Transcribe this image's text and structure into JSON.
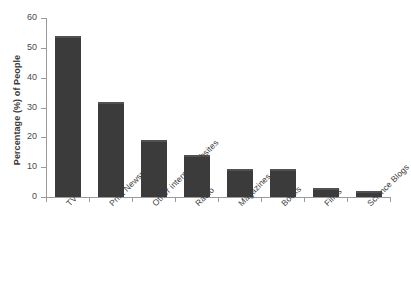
{
  "chart_data": {
    "type": "bar",
    "title": "",
    "subtitle": "",
    "xlabel": "",
    "ylabel": "Percentage (%) of People",
    "categories": [
      "TV",
      "Print Newspapers",
      "Other internet websites",
      "Radio",
      "Magazines",
      "Books",
      "Films",
      "Science Blogs"
    ],
    "values": [
      54,
      32,
      19,
      14,
      9.5,
      9.5,
      3,
      2
    ],
    "series": [
      {
        "name": "Percentage of People",
        "values": [
          54,
          32,
          19,
          14,
          9.5,
          9.5,
          3,
          2
        ]
      }
    ],
    "ylim": [
      0,
      60
    ],
    "yticks": [
      0,
      10,
      20,
      30,
      40,
      50,
      60
    ],
    "ytick_labels": [
      "0",
      "10",
      "20",
      "30",
      "40",
      "50",
      "60"
    ],
    "grid": false,
    "legend": false,
    "legend_position": "none",
    "bar_color": "#3b3b3b",
    "bar_edge_color": "#515151",
    "axis_color": "#9a9a9a",
    "background_color": "#ffffff",
    "xlabel_rotation": -45
  }
}
